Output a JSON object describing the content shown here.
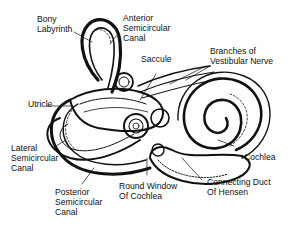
{
  "diagram": {
    "labels": {
      "bony_labyrinth": [
        "Bony",
        "Labyrinth"
      ],
      "anterior_semicircular_canal": [
        "Anterior",
        "Semicircular",
        "Canal"
      ],
      "saccule": [
        "Saccule"
      ],
      "branches_vestibular_nerve": [
        "Branches of",
        "Vestibular Nerve"
      ],
      "utricle": [
        "Utricle"
      ],
      "lateral_semicircular_canal": [
        "Lateral",
        "Semicircular",
        "Canal"
      ],
      "cochlea": [
        "Cochlea"
      ],
      "posterior_semicircular_canal": [
        "Posterior",
        "Semicircular",
        "Canal"
      ],
      "round_window": [
        "Round Window",
        "Of Cochlea"
      ],
      "connecting_duct": [
        "Connecting Duct",
        "Of Hensen"
      ]
    },
    "colors": {
      "ink": "#111111",
      "background": "#ffffff",
      "shade": "#bdbdbd"
    }
  }
}
